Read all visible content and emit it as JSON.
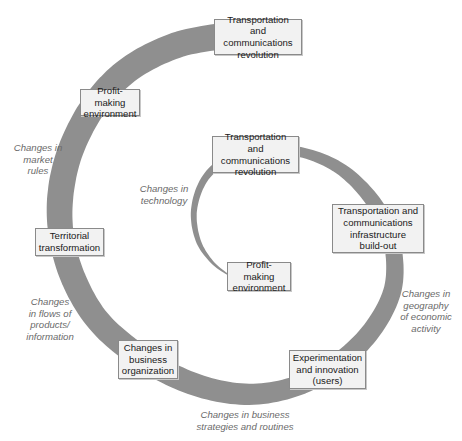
{
  "diagram": {
    "type": "spiral-cycle",
    "colors": {
      "band": "#8f8f8f",
      "box_fill": "#f2f2f2",
      "box_border": "#8a8a8a",
      "note_text": "#6a6a6a",
      "box_text": "#1a1a1a"
    },
    "stages": [
      {
        "id": "outer-transport-revolution",
        "label": "Transportation and\ncommunications\nrevolution"
      },
      {
        "id": "outer-profit-making",
        "label": "Profit-making\nenvironment"
      },
      {
        "id": "territorial-transformation",
        "label": "Territorial\ntransformation"
      },
      {
        "id": "business-organization",
        "label": "Changes in\nbusiness\norganization"
      },
      {
        "id": "experimentation-innovation",
        "label": "Experimentation\nand innovation\n(users)"
      },
      {
        "id": "infrastructure-build-out",
        "label": "Transportation and\ncommunications\ninfrastructure\nbuild-out"
      },
      {
        "id": "inner-transport-revolution",
        "label": "Transportation and\ncommunications\nrevolution"
      },
      {
        "id": "inner-profit-making",
        "label": "Profit-making\nenvironment"
      }
    ],
    "annotations": [
      {
        "id": "market-rules",
        "text": "Changes in\nmarket\nrules"
      },
      {
        "id": "flows",
        "text": "Changes\nin flows of\nproducts/\ninformation"
      },
      {
        "id": "strategies",
        "text": "Changes in business\nstrategies and routines"
      },
      {
        "id": "geography",
        "text": "Changes in\ngeography\nof economic\nactivity"
      },
      {
        "id": "technology",
        "text": "Changes in\ntechnology"
      }
    ]
  }
}
